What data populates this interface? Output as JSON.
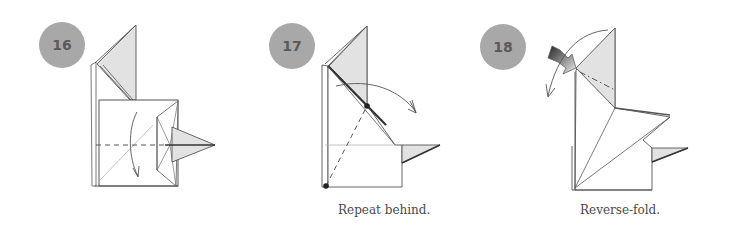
{
  "colors": {
    "badge_fill": "#a8a8a8",
    "badge_text": "#5a5a5a",
    "paper_shade": "#e2e2e2",
    "line": "#555555",
    "caption": "#4a4a4a"
  },
  "steps": [
    {
      "number": "16",
      "caption": "",
      "action": "valley-fold flap down along dashed line"
    },
    {
      "number": "17",
      "caption": "Repeat behind.",
      "action": "valley-fold between marked points"
    },
    {
      "number": "18",
      "caption": "Reverse-fold.",
      "action": "reverse-fold head along dash-dot line"
    }
  ]
}
